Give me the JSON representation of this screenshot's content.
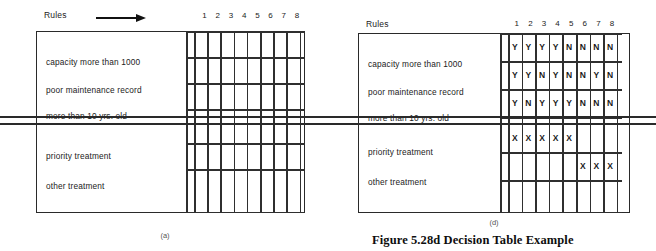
{
  "figure": {
    "caption": "Figure 5.28d Decision Table Example"
  },
  "panels": [
    {
      "id": "a",
      "sublabel": "(a)",
      "rules_label": "Rules",
      "arrow": "right-arrow",
      "column_headers": [
        "1",
        "2",
        "3",
        "4",
        "5",
        "6",
        "7",
        "8"
      ],
      "condition_stub": [
        "capacity more than 1000",
        "poor maintenance record",
        "more than 10 yrs. old"
      ],
      "action_stub": [
        "priority treatment",
        "other treatment"
      ],
      "condition_entries": [
        [
          "",
          "",
          "",
          "",
          "",
          "",
          "",
          ""
        ],
        [
          "",
          "",
          "",
          "",
          "",
          "",
          "",
          ""
        ],
        [
          "",
          "",
          "",
          "",
          "",
          "",
          "",
          ""
        ]
      ],
      "action_entries": [
        [
          "",
          "",
          "",
          "",
          "",
          "",
          "",
          ""
        ],
        [
          "",
          "",
          "",
          "",
          "",
          "",
          "",
          ""
        ]
      ]
    },
    {
      "id": "d",
      "sublabel": "(d)",
      "rules_label": "Rules",
      "arrow": "none",
      "column_headers": [
        "1",
        "2",
        "3",
        "4",
        "5",
        "6",
        "7",
        "8"
      ],
      "condition_stub": [
        "capacity more than 1000",
        "poor maintenance record",
        "more than 10 yrs. old"
      ],
      "action_stub": [
        "priority treatment",
        "other treatment"
      ],
      "condition_entries": [
        [
          "Y",
          "Y",
          "Y",
          "Y",
          "N",
          "N",
          "N",
          "N"
        ],
        [
          "Y",
          "Y",
          "N",
          "Y",
          "N",
          "N",
          "Y",
          "N"
        ],
        [
          "Y",
          "N",
          "Y",
          "Y",
          "Y",
          "N",
          "N",
          "N"
        ]
      ],
      "action_entries": [
        [
          "X",
          "X",
          "X",
          "X",
          "X",
          "",
          "",
          ""
        ],
        [
          "",
          "",
          "",
          "",
          "",
          "X",
          "X",
          "X"
        ]
      ]
    }
  ],
  "colors": {
    "ink": "#2a2a2a",
    "text": "#222222",
    "background": "#ffffff"
  }
}
